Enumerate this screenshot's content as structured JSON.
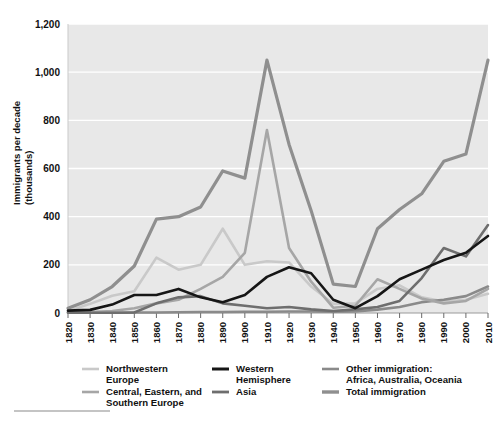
{
  "chart_data": {
    "type": "line",
    "title": "",
    "xlabel": "",
    "ylabel": "Immigrants per decade\n(thousands)",
    "ylabel_line1": "Immigrants per decade",
    "ylabel_line2": "(thousands)",
    "xlim": [
      1820,
      2010
    ],
    "ylim": [
      0,
      1200
    ],
    "ytick_values": [
      0,
      200,
      400,
      600,
      800,
      1000,
      1200
    ],
    "ytick_labels": [
      "0",
      "200",
      "400",
      "600",
      "800",
      "1,000",
      "1,200"
    ],
    "grid": "horizontal",
    "legend_position": "bottom",
    "categories": [
      1820,
      1830,
      1840,
      1850,
      1860,
      1870,
      1880,
      1890,
      1900,
      1910,
      1920,
      1930,
      1940,
      1950,
      1960,
      1970,
      1980,
      1990,
      2000,
      2010
    ],
    "xtick_labels": [
      "1820",
      "1830",
      "1840",
      "1850",
      "1860",
      "1870",
      "1880",
      "1890",
      "1900",
      "1910",
      "1920",
      "1930",
      "1940",
      "1950",
      "1960",
      "1970",
      "1980",
      "1990",
      "2000",
      "2010"
    ],
    "series": [
      {
        "name": "Northwestern Europe",
        "color": "#c9c9c9",
        "width": 2.6,
        "values": [
          8,
          38,
          72,
          90,
          230,
          180,
          200,
          350,
          200,
          215,
          210,
          110,
          38,
          40,
          100,
          115,
          65,
          48,
          55,
          80
        ]
      },
      {
        "name": "Central, Eastern, and Southern Europe",
        "color": "#a6a6a6",
        "width": 2.6,
        "values": [
          2,
          4,
          8,
          20,
          40,
          55,
          100,
          150,
          250,
          760,
          270,
          130,
          22,
          30,
          140,
          100,
          60,
          40,
          50,
          100
        ]
      },
      {
        "name": "Western Hemisphere",
        "color": "#161616",
        "width": 2.6,
        "values": [
          10,
          13,
          35,
          75,
          75,
          100,
          65,
          45,
          75,
          150,
          190,
          165,
          55,
          20,
          70,
          140,
          180,
          220,
          250,
          320
        ]
      },
      {
        "name": "Asia",
        "color": "#6e6e6e",
        "width": 2.6,
        "values": [
          1,
          1,
          1,
          2,
          40,
          65,
          70,
          40,
          30,
          20,
          25,
          15,
          8,
          15,
          25,
          50,
          145,
          270,
          235,
          365
        ]
      },
      {
        "name": "Other immigration: Africa, Australia, Oceania",
        "color": "#8a8a8a",
        "width": 2.6,
        "values": [
          1,
          1,
          1,
          2,
          2,
          3,
          4,
          4,
          5,
          5,
          6,
          6,
          5,
          6,
          14,
          25,
          45,
          55,
          70,
          110
        ]
      },
      {
        "name": "Total immigration",
        "color": "#8f8f8f",
        "width": 3.2,
        "values": [
          20,
          55,
          110,
          195,
          390,
          400,
          440,
          590,
          560,
          1050,
          700,
          425,
          120,
          110,
          350,
          430,
          495,
          630,
          660,
          1050
        ]
      }
    ],
    "legend": {
      "columns": [
        [
          {
            "label_line1": "Northwestern",
            "label_line2": "Europe",
            "color": "#c9c9c9",
            "width": 2.6,
            "name": "northwestern-europe"
          },
          {
            "label_line1": "Central, Eastern, and",
            "label_line2": "Southern Europe",
            "color": "#a6a6a6",
            "width": 2.6,
            "name": "central-eastern-southern-europe"
          }
        ],
        [
          {
            "label_line1": "Western",
            "label_line2": "Hemisphere",
            "color": "#161616",
            "width": 3.0,
            "name": "western-hemisphere"
          },
          {
            "label_line1": "Asia",
            "label_line2": "",
            "color": "#6e6e6e",
            "width": 2.8,
            "name": "asia"
          }
        ],
        [
          {
            "label_line1": "Other immigration:",
            "label_line2": "Africa, Australia, Oceania",
            "color": "#8a8a8a",
            "width": 2.6,
            "name": "other-immigration"
          },
          {
            "label_line1": "Total immigration",
            "label_line2": "",
            "color": "#8f8f8f",
            "width": 3.4,
            "name": "total-immigration"
          }
        ]
      ]
    },
    "colors": {
      "plot_background": "#e8e8e8",
      "gridline": "#ffffff",
      "axis": "#9a9a9a",
      "text": "#111111",
      "page_background": "#ffffff"
    }
  }
}
